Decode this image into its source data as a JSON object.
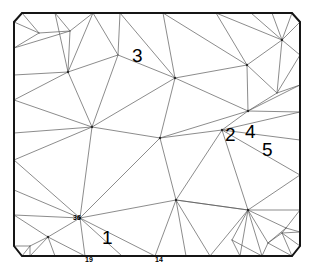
{
  "figure": {
    "type": "mesh-plot",
    "background_color": "#ffffff",
    "boundary_color": "#151515",
    "interior_edge_color": "#5a5a5a",
    "label_color": "#000000"
  },
  "annotations": {
    "large": [
      {
        "id": "label-3",
        "text": "3",
        "x": 132,
        "y": 62,
        "font_size": 19
      },
      {
        "id": "label-2",
        "text": "2",
        "x": 225,
        "y": 141,
        "font_size": 19
      },
      {
        "id": "label-4",
        "text": "4",
        "x": 245,
        "y": 138,
        "font_size": 19
      },
      {
        "id": "label-5",
        "text": "5",
        "x": 262,
        "y": 156,
        "font_size": 19
      },
      {
        "id": "label-1",
        "text": "1",
        "x": 102,
        "y": 244,
        "font_size": 19
      }
    ],
    "small": [
      {
        "id": "label-36",
        "text": "36",
        "x": 73,
        "y": 220,
        "font_size": 7
      },
      {
        "id": "label-19",
        "text": "19",
        "x": 85,
        "y": 262,
        "font_size": 7
      },
      {
        "id": "label-14",
        "text": "14",
        "x": 155,
        "y": 262,
        "font_size": 7
      }
    ]
  },
  "chart_data": {
    "type": "mesh",
    "xlabel": "",
    "ylabel": "",
    "grid": false,
    "legend": null,
    "xlim": [
      14,
      300
    ],
    "ylim": [
      13,
      256
    ],
    "counts": {
      "nodes": 64,
      "boundary_segments": 8
    },
    "boundary_polygon": [
      [
        14,
        22
      ],
      [
        22,
        13
      ],
      [
        292,
        13
      ],
      [
        300,
        22
      ],
      [
        300,
        246
      ],
      [
        292,
        256
      ],
      [
        22,
        256
      ],
      [
        14,
        246
      ]
    ],
    "nodes": [
      {
        "id": 0,
        "x": 14,
        "y": 22
      },
      {
        "id": 1,
        "x": 22,
        "y": 13
      },
      {
        "id": 2,
        "x": 55,
        "y": 13
      },
      {
        "id": 3,
        "x": 93,
        "y": 13
      },
      {
        "id": 4,
        "x": 120,
        "y": 13
      },
      {
        "id": 5,
        "x": 163,
        "y": 13
      },
      {
        "id": 6,
        "x": 216,
        "y": 13
      },
      {
        "id": 7,
        "x": 251,
        "y": 13
      },
      {
        "id": 8,
        "x": 272,
        "y": 13
      },
      {
        "id": 9,
        "x": 292,
        "y": 13
      },
      {
        "id": 10,
        "x": 300,
        "y": 22
      },
      {
        "id": 11,
        "x": 300,
        "y": 55
      },
      {
        "id": 12,
        "x": 300,
        "y": 85
      },
      {
        "id": 13,
        "x": 300,
        "y": 112
      },
      {
        "id": 14,
        "x": 300,
        "y": 140
      },
      {
        "id": 15,
        "x": 300,
        "y": 175
      },
      {
        "id": 16,
        "x": 300,
        "y": 210
      },
      {
        "id": 17,
        "x": 300,
        "y": 232
      },
      {
        "id": 18,
        "x": 300,
        "y": 246
      },
      {
        "id": 19,
        "x": 292,
        "y": 256
      },
      {
        "id": 20,
        "x": 262,
        "y": 256
      },
      {
        "id": 21,
        "x": 240,
        "y": 256
      },
      {
        "id": 22,
        "x": 210,
        "y": 256
      },
      {
        "id": 23,
        "x": 186,
        "y": 256
      },
      {
        "id": 24,
        "x": 155,
        "y": 256
      },
      {
        "id": 25,
        "x": 122,
        "y": 256
      },
      {
        "id": 26,
        "x": 85,
        "y": 256
      },
      {
        "id": 27,
        "x": 55,
        "y": 256
      },
      {
        "id": 28,
        "x": 30,
        "y": 256
      },
      {
        "id": 29,
        "x": 22,
        "y": 256
      },
      {
        "id": 30,
        "x": 14,
        "y": 246
      },
      {
        "id": 31,
        "x": 14,
        "y": 215
      },
      {
        "id": 32,
        "x": 14,
        "y": 190
      },
      {
        "id": 33,
        "x": 14,
        "y": 160
      },
      {
        "id": 34,
        "x": 14,
        "y": 133
      },
      {
        "id": 35,
        "x": 14,
        "y": 100
      },
      {
        "id": 36,
        "x": 14,
        "y": 75
      },
      {
        "id": 37,
        "x": 14,
        "y": 48
      },
      {
        "id": 38,
        "x": 39,
        "y": 33
      },
      {
        "id": 39,
        "x": 70,
        "y": 31
      },
      {
        "id": 40,
        "x": 68,
        "y": 72
      },
      {
        "id": 41,
        "x": 118,
        "y": 55
      },
      {
        "id": 42,
        "x": 175,
        "y": 78
      },
      {
        "id": 43,
        "x": 247,
        "y": 65
      },
      {
        "id": 44,
        "x": 282,
        "y": 40
      },
      {
        "id": 45,
        "x": 277,
        "y": 93
      },
      {
        "id": 46,
        "x": 248,
        "y": 111
      },
      {
        "id": 47,
        "x": 92,
        "y": 127
      },
      {
        "id": 48,
        "x": 160,
        "y": 138
      },
      {
        "id": 49,
        "x": 222,
        "y": 130
      },
      {
        "id": 50,
        "x": 80,
        "y": 218
      },
      {
        "id": 51,
        "x": 176,
        "y": 200
      },
      {
        "id": 52,
        "x": 248,
        "y": 210
      },
      {
        "id": 53,
        "x": 286,
        "y": 228
      },
      {
        "id": 54,
        "x": 48,
        "y": 237
      },
      {
        "id": 55,
        "x": 30,
        "y": 246
      },
      {
        "id": 56,
        "x": 232,
        "y": 240
      },
      {
        "id": 57,
        "x": 268,
        "y": 243
      },
      {
        "id": 58,
        "x": 282,
        "y": 233
      }
    ],
    "edges": [
      [
        0,
        38
      ],
      [
        1,
        38
      ],
      [
        0,
        37
      ],
      [
        37,
        38
      ],
      [
        37,
        39
      ],
      [
        38,
        39
      ],
      [
        2,
        39
      ],
      [
        1,
        2
      ],
      [
        2,
        40
      ],
      [
        39,
        40
      ],
      [
        3,
        39
      ],
      [
        2,
        3
      ],
      [
        3,
        40
      ],
      [
        36,
        37
      ],
      [
        36,
        40
      ],
      [
        35,
        36
      ],
      [
        35,
        40
      ],
      [
        35,
        47
      ],
      [
        34,
        35
      ],
      [
        34,
        47
      ],
      [
        33,
        34
      ],
      [
        33,
        47
      ],
      [
        3,
        41
      ],
      [
        40,
        41
      ],
      [
        4,
        41
      ],
      [
        3,
        4
      ],
      [
        4,
        42
      ],
      [
        41,
        42
      ],
      [
        5,
        42
      ],
      [
        4,
        5
      ],
      [
        5,
        43
      ],
      [
        42,
        43
      ],
      [
        6,
        43
      ],
      [
        5,
        6
      ],
      [
        6,
        44
      ],
      [
        43,
        44
      ],
      [
        7,
        44
      ],
      [
        6,
        7
      ],
      [
        7,
        8
      ],
      [
        8,
        44
      ],
      [
        8,
        9
      ],
      [
        9,
        10
      ],
      [
        9,
        44
      ],
      [
        10,
        44
      ],
      [
        10,
        11
      ],
      [
        11,
        44
      ],
      [
        11,
        45
      ],
      [
        44,
        45
      ],
      [
        43,
        45
      ],
      [
        12,
        45
      ],
      [
        11,
        12
      ],
      [
        12,
        46
      ],
      [
        45,
        46
      ],
      [
        43,
        46
      ],
      [
        13,
        46
      ],
      [
        12,
        13
      ],
      [
        42,
        46
      ],
      [
        40,
        47
      ],
      [
        41,
        47
      ],
      [
        42,
        47
      ],
      [
        42,
        48
      ],
      [
        47,
        48
      ],
      [
        46,
        48
      ],
      [
        46,
        49
      ],
      [
        48,
        49
      ],
      [
        13,
        49
      ],
      [
        13,
        14
      ],
      [
        14,
        49
      ],
      [
        14,
        15
      ],
      [
        15,
        49
      ],
      [
        15,
        52
      ],
      [
        49,
        52
      ],
      [
        48,
        51
      ],
      [
        49,
        51
      ],
      [
        51,
        52
      ],
      [
        47,
        50
      ],
      [
        48,
        50
      ],
      [
        50,
        51
      ],
      [
        33,
        50
      ],
      [
        32,
        33
      ],
      [
        32,
        50
      ],
      [
        31,
        32
      ],
      [
        31,
        50
      ],
      [
        31,
        54
      ],
      [
        50,
        54
      ],
      [
        30,
        31
      ],
      [
        30,
        55
      ],
      [
        54,
        55
      ],
      [
        29,
        55
      ],
      [
        30,
        29
      ],
      [
        28,
        54
      ],
      [
        28,
        55
      ],
      [
        27,
        54
      ],
      [
        27,
        28
      ],
      [
        26,
        54
      ],
      [
        26,
        27
      ],
      [
        26,
        50
      ],
      [
        25,
        50
      ],
      [
        25,
        26
      ],
      [
        24,
        50
      ],
      [
        24,
        25
      ],
      [
        24,
        51
      ],
      [
        23,
        51
      ],
      [
        23,
        24
      ],
      [
        22,
        51
      ],
      [
        22,
        23
      ],
      [
        22,
        52
      ],
      [
        51,
        52
      ],
      [
        21,
        52
      ],
      [
        21,
        22
      ],
      [
        21,
        56
      ],
      [
        52,
        56
      ],
      [
        20,
        56
      ],
      [
        20,
        21
      ],
      [
        20,
        52
      ],
      [
        20,
        57
      ],
      [
        52,
        57
      ],
      [
        19,
        57
      ],
      [
        19,
        20
      ],
      [
        16,
        52
      ],
      [
        15,
        16
      ],
      [
        16,
        53
      ],
      [
        52,
        53
      ],
      [
        17,
        53
      ],
      [
        16,
        17
      ],
      [
        17,
        58
      ],
      [
        53,
        58
      ],
      [
        18,
        58
      ],
      [
        17,
        18
      ],
      [
        18,
        19
      ],
      [
        19,
        58
      ],
      [
        57,
        58
      ],
      [
        53,
        57
      ]
    ]
  }
}
